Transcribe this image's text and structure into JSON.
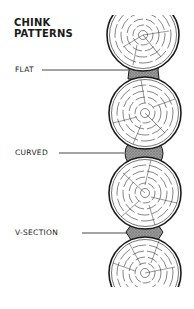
{
  "title": {
    "line1": "CHINK",
    "line2": "PATTERNS"
  },
  "labels": [
    {
      "text": "FLAT",
      "pattern": "flat"
    },
    {
      "text": "CURVED",
      "pattern": "curved"
    },
    {
      "text": "V-SECTION",
      "pattern": "v-section"
    }
  ],
  "colors": {
    "ink": "#1a1a1a",
    "chink_fill": "#8a8a8a",
    "background": "#ffffff"
  }
}
